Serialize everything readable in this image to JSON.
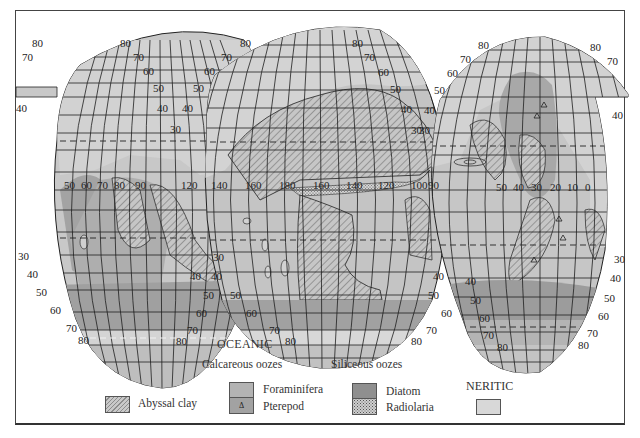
{
  "figure": {
    "heading_oceanic": "OCEANIC",
    "heading_neritic": "NERITIC",
    "group_calcareous": "Calcareous oozes",
    "group_siliceous": "Siliceous oozes"
  },
  "legend": {
    "items": [
      {
        "id": "abyssal",
        "label": "Abyssal clay",
        "pattern": "diagonal-hatch"
      },
      {
        "id": "foraminifera",
        "label": "Foraminifera",
        "color": "#b3b3b3"
      },
      {
        "id": "pterepod",
        "label": "Pterepod",
        "color": "#a2a2a2",
        "symbol": "Δ"
      },
      {
        "id": "diatom",
        "label": "Diatom",
        "color": "#8f8f8f"
      },
      {
        "id": "radiolaria",
        "label": "Radiolaria",
        "pattern": "stipple"
      },
      {
        "id": "neritic",
        "label": "",
        "color": "#d8d8d8"
      }
    ]
  },
  "symbols": {
    "pterepod_marker": "Δ"
  },
  "colors": {
    "land": "#cfcfcf",
    "ocean_light": "#c4c4c4",
    "ocean_mid": "#b3b3b3",
    "ocean_dark": "#979797",
    "grid": "#1e1e1e",
    "frame": "#444444"
  },
  "latitude_labels": {
    "lobe1_left": [
      "80",
      "70",
      "40",
      "30",
      "40",
      "50",
      "60",
      "70",
      "80"
    ],
    "lobe1_right": [
      "80",
      "70",
      "60",
      "50",
      "40",
      "30",
      "30",
      "40",
      "50",
      "60",
      "70",
      "80"
    ],
    "lobe2_left": [
      "80",
      "70",
      "60",
      "50",
      "40",
      "40",
      "50",
      "60",
      "70",
      "80"
    ],
    "lobe2_right": [
      "80",
      "70",
      "60",
      "50",
      "40",
      "30",
      "40",
      "50",
      "60",
      "70",
      "80"
    ],
    "lobe3_left": [
      "80",
      "70",
      "60",
      "50",
      "40",
      "30",
      "40",
      "50",
      "60",
      "70",
      "80"
    ],
    "lobe3_right": [
      "80",
      "70",
      "40",
      "30",
      "40",
      "50",
      "60",
      "70",
      "80"
    ]
  },
  "longitude_labels": {
    "indian": [
      "50",
      "60",
      "70",
      "80",
      "90"
    ],
    "pacific": [
      "120",
      "140",
      "160",
      "180",
      "160",
      "140",
      "120",
      "100",
      "90"
    ],
    "atlantic": [
      "50",
      "40",
      "30",
      "20",
      "10",
      "0"
    ]
  },
  "lat": {
    "l80": "80",
    "l70": "70",
    "l60": "60",
    "l50": "50",
    "l40": "40",
    "l30": "30"
  },
  "lon": {
    "w50": "50",
    "w60": "60",
    "w70": "70",
    "w80": "80",
    "w90": "90",
    "p120a": "120",
    "p140a": "140",
    "p160a": "160",
    "p180": "180",
    "p160b": "160",
    "p140b": "140",
    "p120b": "120",
    "p100": "100",
    "p90": "90",
    "a50": "50",
    "a40": "40",
    "a30": "30",
    "a20": "20",
    "a10": "10",
    "a0": "0"
  }
}
